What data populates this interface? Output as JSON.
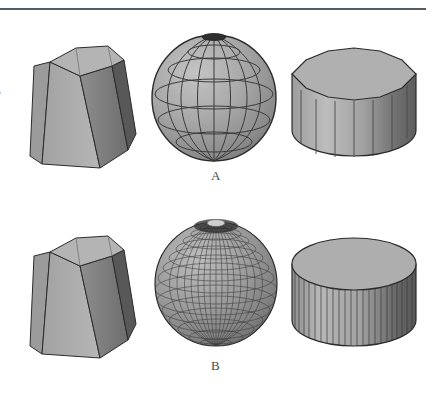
{
  "figure": {
    "title": "",
    "background_color": "#ffffff",
    "rule": {
      "name": "top-horizontal-rule",
      "color": "#555a5e",
      "x": 0,
      "y": 8,
      "width": 426,
      "height": 2
    },
    "margin_glyph": "e",
    "rows": [
      {
        "label": "A",
        "label_x": 211,
        "label_y": 168,
        "tessellation": "coarse",
        "solids": [
          {
            "name": "hexagonal-frustum",
            "kind": "frustum",
            "facets": 6,
            "x": 28,
            "y": 38,
            "width": 110,
            "height": 130
          },
          {
            "name": "faceted-sphere",
            "kind": "sphere",
            "longitudes": 12,
            "latitudes": 7,
            "x": 148,
            "y": 18,
            "width": 130,
            "height": 148
          },
          {
            "name": "faceted-cylinder",
            "kind": "cylinder",
            "facets": 14,
            "x": 288,
            "y": 38,
            "width": 130,
            "height": 130
          }
        ]
      },
      {
        "label": "B",
        "label_x": 211,
        "label_y": 358,
        "tessellation": "fine",
        "solids": [
          {
            "name": "hexagonal-frustum",
            "kind": "frustum",
            "facets": 6,
            "x": 28,
            "y": 228,
            "width": 110,
            "height": 130
          },
          {
            "name": "faceted-sphere",
            "kind": "sphere",
            "longitudes": 32,
            "latitudes": 20,
            "x": 152,
            "y": 208,
            "width": 126,
            "height": 146
          },
          {
            "name": "faceted-cylinder",
            "kind": "cylinder",
            "facets": 36,
            "x": 288,
            "y": 228,
            "width": 130,
            "height": 130
          }
        ]
      }
    ],
    "colors": {
      "face_light": "#b2b2b2",
      "face_mid": "#9a9a9a",
      "face_dark": "#6f6f6f",
      "face_darkest": "#4d4d4d",
      "top_face": "#a8a8a8",
      "outline": "#2b2b2b",
      "mesh_line": "#3a3a3a",
      "label": "#4a4a4a"
    }
  }
}
